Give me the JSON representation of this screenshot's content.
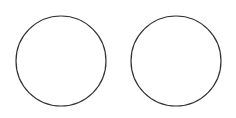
{
  "canvas": {
    "width": 236,
    "height": 118,
    "background": "#ffffff"
  },
  "shapes": [
    {
      "type": "circle",
      "name": "left-circle",
      "cx": 61,
      "cy": 61,
      "r": 45,
      "stroke": "#333333",
      "fill": "none",
      "stroke_width": 1.2
    },
    {
      "type": "circle",
      "name": "right-circle",
      "cx": 176,
      "cy": 61,
      "r": 45,
      "stroke": "#333333",
      "fill": "none",
      "stroke_width": 1.2
    }
  ]
}
